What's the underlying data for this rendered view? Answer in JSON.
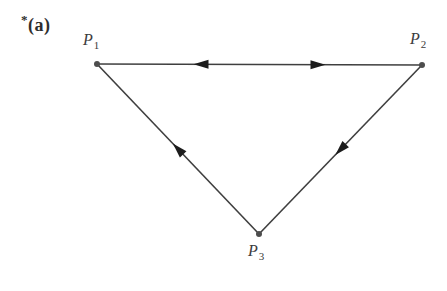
{
  "figure": {
    "star": "*",
    "label": "(a)"
  },
  "diagram": {
    "type": "directed-graph-triangle",
    "canvas": {
      "width": 447,
      "height": 291
    },
    "colors": {
      "background": "#ffffff",
      "line": "#3f3f3f",
      "arrow": "#1c1c1c",
      "dot": "#4d4d4d",
      "text": "#3c3c3c"
    },
    "dot_radius": 3,
    "arrow": {
      "length": 15,
      "width": 9
    },
    "line_width": 1.6,
    "points": [
      {
        "id": "P1",
        "letter": "P",
        "sub": "1",
        "x": 97,
        "y": 64,
        "label_x": 83,
        "label_y": 32
      },
      {
        "id": "P2",
        "letter": "P",
        "sub": "2",
        "x": 422,
        "y": 65,
        "label_x": 410,
        "label_y": 31
      },
      {
        "id": "P3",
        "letter": "P",
        "sub": "3",
        "x": 259,
        "y": 234,
        "label_x": 248,
        "label_y": 243
      }
    ],
    "edges": [
      {
        "from": "P1",
        "to": "P2",
        "arrows": [
          {
            "t": 0.32,
            "dir": -1
          },
          {
            "t": 0.68,
            "dir": 1
          }
        ]
      },
      {
        "from": "P3",
        "to": "P1",
        "arrows": [
          {
            "t": 0.5,
            "dir": 1
          }
        ]
      },
      {
        "from": "P2",
        "to": "P3",
        "arrows": [
          {
            "t": 0.5,
            "dir": 1
          }
        ]
      }
    ]
  }
}
